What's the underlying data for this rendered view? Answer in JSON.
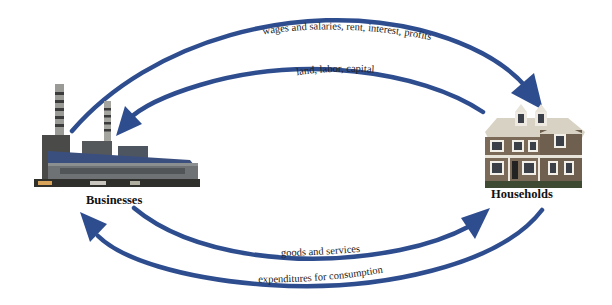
{
  "diagram": {
    "type": "circular-flow",
    "arrow_color": "#2e4d8f",
    "nodes": {
      "businesses": {
        "label": "Businesses",
        "icon": "factory-icon"
      },
      "households": {
        "label": "Households",
        "icon": "house-icon"
      }
    },
    "flows": [
      {
        "id": "wages",
        "label": "wages and salaries, rent, interest, profits",
        "from": "Businesses",
        "to": "Households"
      },
      {
        "id": "resources",
        "label": "land, labor, capital",
        "from": "Households",
        "to": "Businesses"
      },
      {
        "id": "goods",
        "label": "goods and services",
        "from": "Businesses",
        "to": "Households"
      },
      {
        "id": "expenditures",
        "label": "expenditures for consumption",
        "from": "Households",
        "to": "Businesses"
      }
    ]
  }
}
